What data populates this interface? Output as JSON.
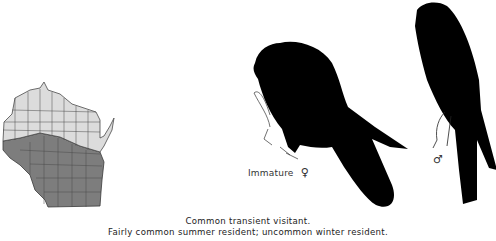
{
  "figure": {
    "map": {
      "region": "Wisconsin",
      "legend_hint": "north region light (transient), south region dark (summer resident)",
      "colors": {
        "north": "#dcdcdc",
        "south": "#7d7d7d",
        "county_lines": "#4a4a4a"
      }
    },
    "illustrations": [
      {
        "id": "female",
        "label": "Immature",
        "sex_symbol": "♀"
      },
      {
        "id": "male",
        "label": "",
        "sex_symbol": "♂"
      }
    ],
    "caption": {
      "line1": "Common transient visitant.",
      "line2": "Fairly common summer resident; uncommon winter resident."
    }
  }
}
